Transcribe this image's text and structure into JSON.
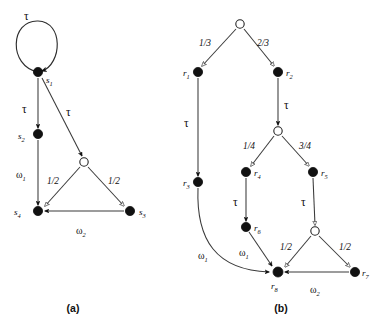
{
  "figure": {
    "captions": [
      {
        "id": "caption-a",
        "text": "(a)",
        "x": 73,
        "y": 310
      },
      {
        "id": "caption-b",
        "text": "(b)",
        "x": 281,
        "y": 310
      }
    ]
  },
  "diagram_a": {
    "id": "diagram-a",
    "nodes": [
      {
        "id": "s1",
        "label": "s",
        "sub": "1",
        "type": "filled",
        "x": 38,
        "y": 72,
        "lx": 46,
        "ly": 82
      },
      {
        "id": "s2",
        "label": "s",
        "sub": "2",
        "type": "filled",
        "x": 38,
        "y": 134,
        "lx": 21,
        "ly": 139
      },
      {
        "id": "prob_a",
        "label": "",
        "sub": "",
        "type": "open",
        "x": 84,
        "y": 162,
        "lx": 0,
        "ly": 0
      },
      {
        "id": "s4",
        "label": "s",
        "sub": "4",
        "type": "filled",
        "x": 38,
        "y": 211,
        "lx": 17,
        "ly": 214
      },
      {
        "id": "s3",
        "label": "s",
        "sub": "3",
        "type": "filled",
        "x": 130,
        "y": 211,
        "lx": 139,
        "ly": 214
      }
    ],
    "edges": [
      {
        "id": "a-s1-self",
        "from": "s1",
        "to": "s1",
        "label": "τ",
        "kind": "tau",
        "arrow": "solid",
        "lx": 24,
        "ly": 16
      },
      {
        "id": "a-s1-s2",
        "from": "s1",
        "to": "s2",
        "label": "τ",
        "kind": "tau",
        "arrow": "solid",
        "lx": 24,
        "ly": 111
      },
      {
        "id": "a-s1-prob",
        "from": "s1",
        "to": "prob_a",
        "label": "τ",
        "kind": "tau",
        "arrow": "solid",
        "lx": 68,
        "ly": 113
      },
      {
        "id": "a-s2-s4",
        "from": "s2",
        "to": "s4",
        "label": "ω",
        "sub": "1",
        "kind": "omega",
        "arrow": "solid",
        "lx": 18,
        "ly": 175
      },
      {
        "id": "a-prob-s4",
        "from": "prob_a",
        "to": "s4",
        "label": "1/2",
        "kind": "prob",
        "arrow": "open",
        "lx": 50,
        "ly": 182
      },
      {
        "id": "a-prob-s3",
        "from": "prob_a",
        "to": "s3",
        "label": "1/2",
        "kind": "prob",
        "arrow": "open",
        "lx": 111,
        "ly": 182
      },
      {
        "id": "a-s3-s4",
        "from": "s3",
        "to": "s4",
        "label": "ω",
        "sub": "2",
        "kind": "omega",
        "arrow": "solid",
        "lx": 78,
        "ly": 231
      }
    ]
  },
  "diagram_b": {
    "id": "diagram-b",
    "nodes": [
      {
        "id": "b_root",
        "label": "",
        "sub": "",
        "type": "open",
        "x": 240,
        "y": 24,
        "lx": 0,
        "ly": 0
      },
      {
        "id": "r1",
        "label": "r",
        "sub": "1",
        "type": "filled",
        "x": 198,
        "y": 72,
        "lx": 185,
        "ly": 76
      },
      {
        "id": "r2",
        "label": "r",
        "sub": "2",
        "type": "filled",
        "x": 278,
        "y": 72,
        "lx": 287,
        "ly": 76
      },
      {
        "id": "r3",
        "label": "r",
        "sub": "3",
        "type": "filled",
        "x": 198,
        "y": 182,
        "lx": 185,
        "ly": 186
      },
      {
        "id": "prob_b_mid",
        "label": "",
        "sub": "",
        "type": "open",
        "x": 278,
        "y": 131,
        "lx": 0,
        "ly": 0
      },
      {
        "id": "r4",
        "label": "r",
        "sub": "4",
        "type": "filled",
        "x": 246,
        "y": 172,
        "lx": 255,
        "ly": 176
      },
      {
        "id": "r5",
        "label": "r",
        "sub": "5",
        "type": "filled",
        "x": 313,
        "y": 172,
        "lx": 322,
        "ly": 176
      },
      {
        "id": "r6",
        "label": "r",
        "sub": "6",
        "type": "filled",
        "x": 246,
        "y": 227,
        "lx": 255,
        "ly": 231
      },
      {
        "id": "prob_b_low",
        "label": "",
        "sub": "",
        "type": "open",
        "x": 315,
        "y": 231,
        "lx": 0,
        "ly": 0
      },
      {
        "id": "r8",
        "label": "r",
        "sub": "8",
        "type": "filled",
        "x": 278,
        "y": 272,
        "lx": 272,
        "ly": 288
      },
      {
        "id": "r7",
        "label": "r",
        "sub": "7",
        "type": "filled",
        "x": 355,
        "y": 272,
        "lx": 363,
        "ly": 276
      }
    ],
    "edges": [
      {
        "id": "b-root-r1",
        "from": "b_root",
        "to": "r1",
        "label": "1/3",
        "kind": "prob",
        "arrow": "open",
        "lx": 203,
        "ly": 43
      },
      {
        "id": "b-root-r2",
        "from": "b_root",
        "to": "r2",
        "label": "2/3",
        "kind": "prob",
        "arrow": "open",
        "lx": 259,
        "ly": 43
      },
      {
        "id": "b-r1-r3",
        "from": "r1",
        "to": "r3",
        "label": "τ",
        "kind": "tau",
        "arrow": "solid",
        "lx": 186,
        "ly": 124
      },
      {
        "id": "b-r2-prob",
        "from": "r2",
        "to": "prob_b_mid",
        "label": "τ",
        "kind": "tau",
        "arrow": "solid",
        "lx": 285,
        "ly": 106
      },
      {
        "id": "b-prob-r4",
        "from": "prob_b_mid",
        "to": "r4",
        "label": "1/4",
        "kind": "prob",
        "arrow": "open",
        "lx": 246,
        "ly": 146
      },
      {
        "id": "b-prob-r5",
        "from": "prob_b_mid",
        "to": "r5",
        "label": "3/4",
        "kind": "prob",
        "arrow": "open",
        "lx": 302,
        "ly": 146
      },
      {
        "id": "b-r4-r6",
        "from": "r4",
        "to": "r6",
        "label": "τ",
        "kind": "tau",
        "arrow": "solid",
        "lx": 235,
        "ly": 203
      },
      {
        "id": "b-r5-prob",
        "from": "r5",
        "to": "prob_b_low",
        "label": "τ",
        "kind": "tau",
        "arrow": "solid",
        "lx": 303,
        "ly": 203
      },
      {
        "id": "b-r3-r8",
        "from": "r3",
        "to": "r8",
        "label": "ω",
        "sub": "1",
        "kind": "omega",
        "arrow": "solid",
        "lx": 201,
        "ly": 256
      },
      {
        "id": "b-r6-r8",
        "from": "r6",
        "to": "r8",
        "label": "ω",
        "sub": "1",
        "kind": "omega",
        "arrow": "solid",
        "lx": 242,
        "ly": 253
      },
      {
        "id": "b-problow-r8",
        "from": "prob_b_low",
        "to": "r8",
        "label": "1/2",
        "kind": "prob",
        "arrow": "open",
        "lx": 283,
        "ly": 248
      },
      {
        "id": "b-problow-r7",
        "from": "prob_b_low",
        "to": "r7",
        "label": "1/2",
        "kind": "prob",
        "arrow": "open",
        "lx": 342,
        "ly": 248
      },
      {
        "id": "b-r7-r8",
        "from": "r7",
        "to": "r8",
        "label": "ω",
        "sub": "2",
        "kind": "omega",
        "arrow": "solid",
        "lx": 313,
        "ly": 290
      }
    ]
  },
  "background_artifacts": [
    {
      "text": "a fraction of a second",
      "x": 14,
      "y": 30
    },
    {
      "text": "will be given for all",
      "x": 120,
      "y": 30
    },
    {
      "text": "an instance of the",
      "x": 196,
      "y": 8
    },
    {
      "text": "the state transition",
      "x": 210,
      "y": 44
    }
  ],
  "colors": {
    "ink": "#111111",
    "edge": "#3a3a3a",
    "background": "#ffffff"
  }
}
